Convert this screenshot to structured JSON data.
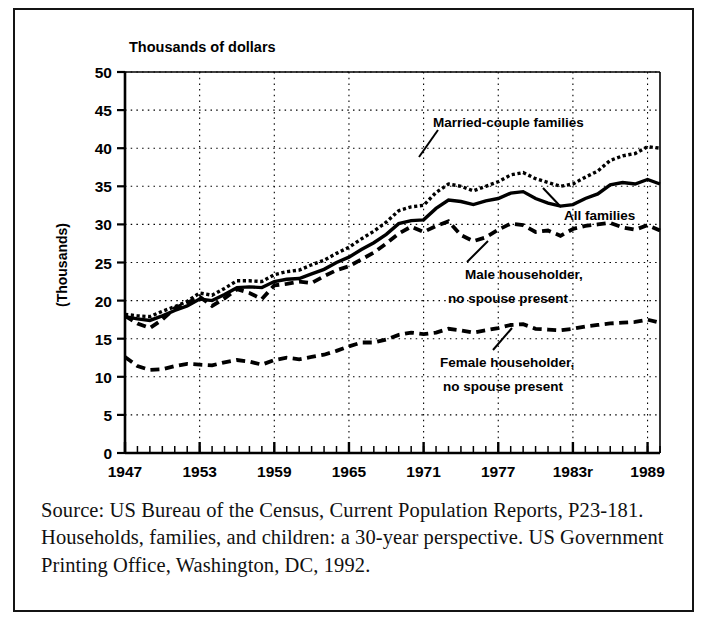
{
  "figure": {
    "title": "Thousands of dollars",
    "ylabel": "(Thousands)",
    "source": "Source: US Bureau of the Census, Current Population Reports, P23-181. Households, families, and children: a 30-year perspective. US Government Printing Office, Washington, DC, 1992."
  },
  "annotations": {
    "married": "Married-couple families",
    "all": "All families",
    "male_l1": "Male householder,",
    "male_l2": "no spouse present",
    "female_l1": "Female householder,",
    "female_l2": "no spouse present"
  },
  "chart_data": {
    "type": "line",
    "title": "Thousands of dollars",
    "xlabel": "",
    "ylabel": "(Thousands)",
    "xlim": [
      1947,
      1990
    ],
    "ylim": [
      0,
      50
    ],
    "ytick_labels": [
      "0",
      "5",
      "10",
      "15",
      "20",
      "25",
      "30",
      "35",
      "40",
      "45",
      "50"
    ],
    "yticks": [
      0,
      5,
      10,
      15,
      20,
      25,
      30,
      35,
      40,
      45,
      50
    ],
    "xtick_labels": [
      "1947",
      "1953",
      "1959",
      "1965",
      "1971",
      "1977",
      "1983r",
      "1989"
    ],
    "xticks": [
      1947,
      1953,
      1959,
      1965,
      1971,
      1977,
      1983,
      1989
    ],
    "grid": true,
    "legend": "inline-annotations",
    "x": [
      1947,
      1948,
      1949,
      1950,
      1951,
      1952,
      1953,
      1954,
      1955,
      1956,
      1957,
      1958,
      1959,
      1960,
      1961,
      1962,
      1963,
      1964,
      1965,
      1966,
      1967,
      1968,
      1969,
      1970,
      1971,
      1972,
      1973,
      1974,
      1975,
      1976,
      1977,
      1978,
      1979,
      1980,
      1981,
      1982,
      1983,
      1984,
      1985,
      1986,
      1987,
      1988,
      1989,
      1990
    ],
    "series": [
      {
        "name": "Married-couple families",
        "style": "dotted",
        "values": [
          18.2,
          18.0,
          17.9,
          18.6,
          19.2,
          19.9,
          21.0,
          20.7,
          21.6,
          22.6,
          22.6,
          22.5,
          23.4,
          23.8,
          24.0,
          24.7,
          25.3,
          26.2,
          27.0,
          28.1,
          29.1,
          30.3,
          31.8,
          32.3,
          32.5,
          34.2,
          35.3,
          35.0,
          34.4,
          35.0,
          35.6,
          36.5,
          36.8,
          36.0,
          35.5,
          35.0,
          35.3,
          36.2,
          37.0,
          38.4,
          39.0,
          39.3,
          40.2,
          40.0
        ]
      },
      {
        "name": "All families",
        "style": "solid",
        "values": [
          17.9,
          17.6,
          17.4,
          18.0,
          18.7,
          19.3,
          20.2,
          20.0,
          20.8,
          21.7,
          21.8,
          21.7,
          22.5,
          22.8,
          22.9,
          23.5,
          24.1,
          25.0,
          25.7,
          26.7,
          27.6,
          28.7,
          30.1,
          30.5,
          30.6,
          32.1,
          33.2,
          33.0,
          32.6,
          33.1,
          33.4,
          34.1,
          34.3,
          33.4,
          32.8,
          32.4,
          32.6,
          33.4,
          34.0,
          35.2,
          35.5,
          35.3,
          35.9,
          35.3
        ]
      },
      {
        "name": "Male householder, no spouse present",
        "style": "dashed",
        "values": [
          18.0,
          17.0,
          16.4,
          17.5,
          19.0,
          19.7,
          20.5,
          19.3,
          20.3,
          21.5,
          21.0,
          20.2,
          22.0,
          22.2,
          22.5,
          22.3,
          23.2,
          24.0,
          24.5,
          25.4,
          26.3,
          27.5,
          28.8,
          29.7,
          29.0,
          29.8,
          30.4,
          28.6,
          27.8,
          28.3,
          29.3,
          30.1,
          29.9,
          29.0,
          29.2,
          28.5,
          29.4,
          29.8,
          30.0,
          30.2,
          29.6,
          29.3,
          29.9,
          29.2
        ]
      },
      {
        "name": "Female householder, no spouse present",
        "style": "dashed",
        "values": [
          12.6,
          11.4,
          10.9,
          11.0,
          11.4,
          11.7,
          11.6,
          11.5,
          11.9,
          12.2,
          12.0,
          11.6,
          12.2,
          12.5,
          12.3,
          12.6,
          12.9,
          13.4,
          14.0,
          14.5,
          14.5,
          14.9,
          15.5,
          15.8,
          15.6,
          15.8,
          16.3,
          16.1,
          15.8,
          16.1,
          16.4,
          16.8,
          16.9,
          16.3,
          16.2,
          16.1,
          16.3,
          16.6,
          16.8,
          17.0,
          17.1,
          17.2,
          17.5,
          17.1
        ]
      }
    ]
  }
}
